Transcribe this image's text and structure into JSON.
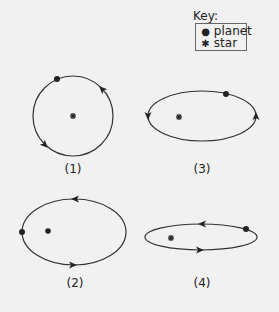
{
  "key": {
    "title": "Key:",
    "items": [
      {
        "symbol": "planet-dot",
        "glyph": "●",
        "label": "planet"
      },
      {
        "symbol": "star-asterisk",
        "glyph": "✱",
        "label": "star"
      }
    ]
  },
  "colors": {
    "background": "#f1f1f1",
    "ink": "#222222"
  },
  "orbits": [
    {
      "label": "(1)",
      "shape": "circle",
      "cx": 73,
      "cy": 116,
      "rx": 40,
      "ry": 40,
      "star": [
        73,
        116
      ],
      "planet": [
        57,
        79
      ]
    },
    {
      "label": "(2)",
      "shape": "ellipse",
      "cx": 74,
      "cy": 232,
      "rx": 52,
      "ry": 33,
      "star": [
        48,
        231
      ],
      "planet": [
        22,
        232
      ]
    },
    {
      "label": "(3)",
      "shape": "ellipse",
      "cx": 202,
      "cy": 116,
      "rx": 54,
      "ry": 25,
      "star": [
        179,
        117
      ],
      "planet": [
        226,
        94
      ]
    },
    {
      "label": "(4)",
      "shape": "ellipse",
      "cx": 201,
      "cy": 237,
      "rx": 56,
      "ry": 13,
      "star": [
        171,
        238
      ],
      "planet": [
        246,
        229
      ]
    }
  ]
}
